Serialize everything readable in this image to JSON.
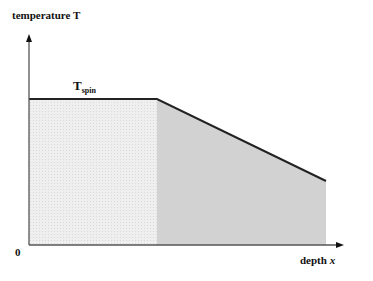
{
  "diagram": {
    "y_axis_label": "temperature T",
    "x_axis_label_text": "depth ",
    "x_axis_label_var": "x",
    "plateau_label_main": "T",
    "plateau_label_sub": "spin",
    "origin_label": "0",
    "colors": {
      "axis": "#555555",
      "profile_line": "#222222",
      "plateau_fill": "#ececec",
      "slope_fill": "#d2d2d2"
    },
    "geometry": {
      "origin": [
        29,
        245
      ],
      "y_axis_top": 36,
      "x_axis_end": 343,
      "plateau_y": 99,
      "plateau_end_x": 157,
      "slope_end": [
        326,
        181
      ]
    }
  }
}
